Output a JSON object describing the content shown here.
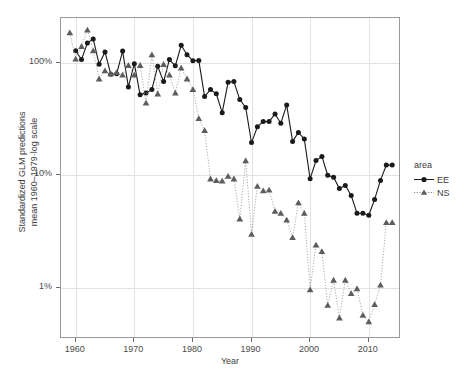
{
  "chart_data": {
    "type": "line",
    "title": "",
    "xlabel": "Year",
    "ylabel": "Standardized GLM predictions\nmean 1960–1979·log scale",
    "yscale": "log",
    "ylim": [
      0.35,
      250
    ],
    "xlim": [
      1957.5,
      2015.5
    ],
    "grid": true,
    "legend": {
      "title": "area",
      "position": "right",
      "entries": [
        {
          "name": "EE",
          "marker": "filled-circle",
          "line": "solid",
          "color": "#1a1a1a"
        },
        {
          "name": "NS",
          "marker": "filled-triangle",
          "line": "dotted",
          "color": "#5d5d5d"
        }
      ]
    },
    "xticks": [
      1960,
      1970,
      1980,
      1990,
      2000,
      2010
    ],
    "xticklabels": [
      "1960",
      "1970",
      "1980",
      "1990",
      "2000",
      "2010"
    ],
    "yticks": [
      1,
      10,
      100
    ],
    "yticklabels": [
      "1%",
      "10%",
      "100%"
    ],
    "series": [
      {
        "name": "EE",
        "marker": "filled-circle",
        "line": "solid",
        "color": "#1a1a1a",
        "x": [
          1960,
          1961,
          1962,
          1963,
          1964,
          1965,
          1966,
          1967,
          1968,
          1969,
          1970,
          1971,
          1972,
          1973,
          1974,
          1975,
          1976,
          1977,
          1978,
          1979,
          1980,
          1981,
          1982,
          1983,
          1984,
          1985,
          1986,
          1987,
          1988,
          1989,
          1990,
          1991,
          1992,
          1993,
          1994,
          1995,
          1996,
          1997,
          1998,
          1999,
          2000,
          2001,
          2002,
          2003,
          2004,
          2005,
          2006,
          2007,
          2008,
          2009,
          2010,
          2011,
          2012,
          2013,
          2014
        ],
        "y": [
          128,
          107,
          150,
          163,
          97,
          125,
          79,
          80,
          127,
          61,
          98,
          52,
          54,
          58,
          93,
          68,
          107,
          94,
          143,
          118,
          104,
          105,
          50,
          58,
          53,
          36,
          67,
          68,
          47,
          40,
          19.5,
          27,
          30,
          30,
          35,
          29,
          42,
          20,
          24,
          21,
          9.3,
          13.5,
          14.7,
          10.0,
          9.6,
          7.6,
          8.1,
          6.6,
          4.6,
          4.6,
          4.4,
          6.1,
          9.0,
          12.3,
          12.3
        ]
      },
      {
        "name": "NS",
        "marker": "filled-triangle",
        "line": "dotted",
        "color": "#5d5d5d",
        "x": [
          1959,
          1960,
          1961,
          1962,
          1963,
          1964,
          1965,
          1966,
          1967,
          1968,
          1969,
          1970,
          1971,
          1972,
          1973,
          1974,
          1975,
          1976,
          1977,
          1978,
          1979,
          1980,
          1981,
          1982,
          1983,
          1984,
          1985,
          1986,
          1987,
          1988,
          1989,
          1990,
          1991,
          1992,
          1993,
          1994,
          1995,
          1996,
          1997,
          1998,
          1999,
          2000,
          2001,
          2002,
          2003,
          2004,
          2005,
          2006,
          2007,
          2008,
          2009,
          2010,
          2011,
          2012,
          2013,
          2014
        ],
        "y": [
          185,
          108,
          140,
          196,
          128,
          72,
          85,
          80,
          82,
          78,
          95,
          78,
          95,
          44,
          118,
          53,
          97,
          78,
          54,
          90,
          72,
          58,
          32,
          25,
          9.3,
          9.0,
          8.9,
          9.8,
          9.3,
          4.1,
          13.5,
          3.0,
          8.0,
          7.3,
          7.4,
          4.8,
          4.6,
          4.0,
          2.8,
          5.7,
          4.6,
          0.96,
          2.4,
          2.1,
          0.7,
          1.17,
          0.54,
          1.17,
          0.89,
          0.98,
          0.57,
          0.5,
          0.71,
          1.06,
          3.8,
          3.8
        ]
      }
    ]
  },
  "axes": {
    "x_title": "Year",
    "y_title_line1": "Standardized GLM predictions",
    "y_title_line2": "mean 1960–1979·log scale"
  },
  "legend": {
    "title": "area",
    "item_ee": "EE",
    "item_ns": "NS"
  },
  "ticks": {
    "x": [
      "1960",
      "1970",
      "1980",
      "1990",
      "2000",
      "2010"
    ],
    "y": [
      "100%",
      "10%",
      "1%"
    ]
  }
}
